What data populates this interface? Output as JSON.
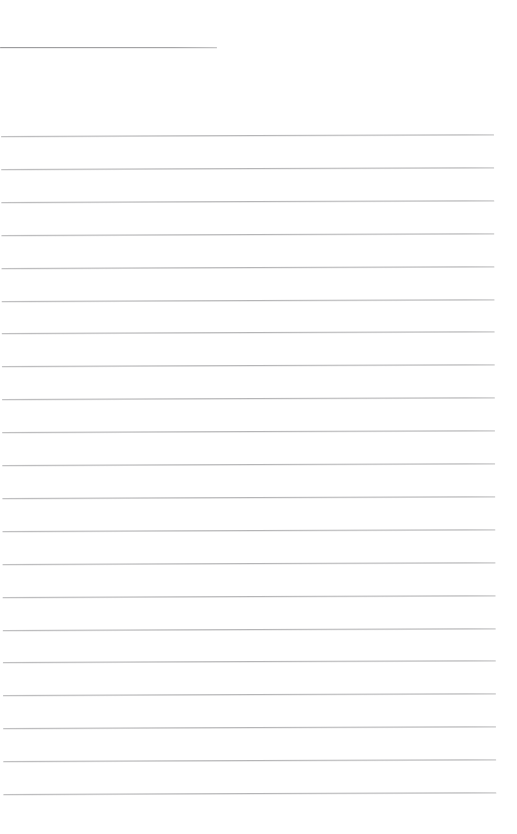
{
  "page": {
    "kind": "blank-ruled-notebook-page",
    "background_color": "#ffffff",
    "width": 517,
    "height": 834
  },
  "header_line": {
    "x": 0,
    "y": 47,
    "width": 217,
    "thickness": 1,
    "color": "#969698"
  },
  "ruled_lines": {
    "count": 21,
    "first_y": 135,
    "spacing": 32.9,
    "left": 2,
    "right": 495,
    "thickness": 1,
    "color": "#a8a8aa"
  }
}
